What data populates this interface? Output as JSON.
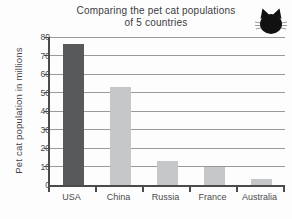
{
  "title": {
    "line1": "Comparing the pet cat populations",
    "line2": "of 5 countries"
  },
  "y_axis": {
    "label": "Pet cat population in millions",
    "ticks": [
      0,
      10,
      20,
      30,
      40,
      50,
      60,
      70,
      80
    ]
  },
  "icons": {
    "cat": "cat-head-icon"
  },
  "colors": {
    "bar_dark": "#58595b",
    "bar_light": "#c6c7c9",
    "gridline": "#98999b",
    "axis": "#4b4b4d",
    "text": "#404042",
    "background": "#fdfdfd",
    "cat_icon": "#111111"
  },
  "chart_data": {
    "type": "bar",
    "title": "Comparing the pet cat populations of 5 countries",
    "categories": [
      "USA",
      "China",
      "Russia",
      "France",
      "Australia"
    ],
    "values": [
      76,
      53,
      13,
      10,
      3
    ],
    "bar_colors": [
      "#58595b",
      "#c6c7c9",
      "#c6c7c9",
      "#c6c7c9",
      "#c6c7c9"
    ],
    "xlabel": "",
    "ylabel": "Pet cat population in millions",
    "ylim": [
      0,
      80
    ],
    "ytick_step": 10,
    "grid": true,
    "legend": "none"
  }
}
